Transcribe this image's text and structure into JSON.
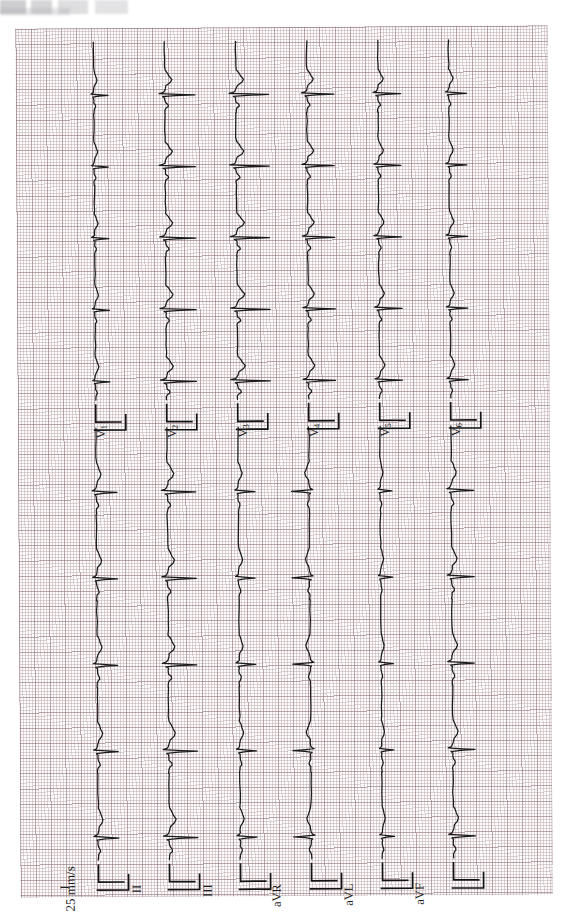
{
  "document": {
    "title": "12-Lead Electrocardiogram",
    "orientation": "rotated-90",
    "header_artifact_text": ""
  },
  "paper": {
    "grid_small_mm": 1,
    "grid_bold_every": 5,
    "grid_color_fine": "#b29ba0",
    "grid_color_bold": "#96788 0",
    "paper_bg": "#fdfcfc",
    "trace_color": "#1a1a1a"
  },
  "annotations": {
    "paper_speed": "25 mm/s",
    "calibration_label": ""
  },
  "limb_leads": [
    {
      "id": "I",
      "label": "I",
      "sub": ""
    },
    {
      "id": "II",
      "label": "II",
      "sub": ""
    },
    {
      "id": "III",
      "label": "III",
      "sub": ""
    },
    {
      "id": "aVR",
      "label": "aVR",
      "sub": ""
    },
    {
      "id": "aVL",
      "label": "aVL",
      "sub": ""
    },
    {
      "id": "aVF",
      "label": "aVF",
      "sub": ""
    }
  ],
  "precordial_leads": [
    {
      "id": "V1",
      "label": "V",
      "sub": "1"
    },
    {
      "id": "V2",
      "label": "V",
      "sub": "2"
    },
    {
      "id": "V3",
      "label": "V",
      "sub": "3"
    },
    {
      "id": "V4",
      "label": "V",
      "sub": "4"
    },
    {
      "id": "V5",
      "label": "V",
      "sub": "5"
    },
    {
      "id": "V6",
      "label": "V",
      "sub": "6"
    }
  ],
  "chart_data": {
    "type": "line",
    "xlabel": "Time",
    "ylabel": "Amplitude (mV)",
    "paper_speed": "25 mm/s",
    "calibration": "10 mm/mV",
    "beats_per_strip": 5,
    "strip_count": 12,
    "lead_order": [
      "I",
      "II",
      "III",
      "aVR",
      "aVL",
      "aVF",
      "V1",
      "V2",
      "V3",
      "V4",
      "V5",
      "V6"
    ],
    "lead_amplitude_scale": {
      "I": 0.72,
      "II": 1.0,
      "III": 0.58,
      "aVR": -0.62,
      "aVL": 0.42,
      "aVF": 0.78,
      "V1": 0.5,
      "V2": 1.05,
      "V3": 1.15,
      "V4": 0.95,
      "V5": 0.8,
      "V6": 0.62
    },
    "beat_template_mV": {
      "p_wave": 0.12,
      "q_wave": -0.08,
      "r_wave": 1.1,
      "s_wave": -0.22,
      "t_wave": 0.26
    }
  }
}
